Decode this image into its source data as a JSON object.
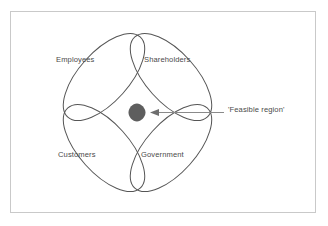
{
  "figure": {
    "type": "four-set-venn-diagram",
    "background_color": "#ffffff",
    "frame_color": "#c9c9c9",
    "stroke_color": "#555555",
    "text_color": "#4a4a4a",
    "highlight_color": "#5e5e5e",
    "labels": [
      {
        "id": "employees",
        "text": "Employees",
        "position": "top-left"
      },
      {
        "id": "shareholders",
        "text": "Shareholders",
        "position": "top-right"
      },
      {
        "id": "customers",
        "text": "Customers",
        "position": "bottom-left"
      },
      {
        "id": "government",
        "text": "Government",
        "position": "bottom-right"
      }
    ],
    "annotation": {
      "text": "'Feasible region'",
      "points_to": "center-overlap",
      "arrow_direction": "left"
    }
  }
}
